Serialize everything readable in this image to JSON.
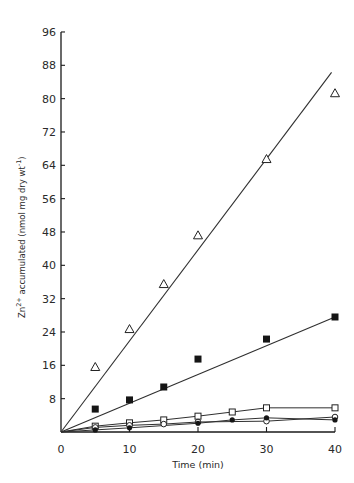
{
  "chart_data": {
    "type": "scatter",
    "title": "",
    "xlabel": "Time (min)",
    "ylabel": "Zn2+ accumulated (nmol mg dry wt-1)",
    "ylabel_parts": {
      "main": "Zn",
      "sup1": "2+",
      "mid": " accumulated (nmol  mg  dry  wt",
      "sup2": "-1",
      "end": ")"
    },
    "xlim": [
      0,
      40
    ],
    "ylim": [
      0,
      96
    ],
    "xticks": [
      0,
      10,
      20,
      30,
      40
    ],
    "yticks": [
      8,
      16,
      24,
      32,
      40,
      48,
      56,
      64,
      72,
      80,
      88,
      96
    ],
    "origin_label": "0",
    "grid": false,
    "legend": null,
    "series": [
      {
        "name": "open triangles",
        "marker": "triangle-open",
        "fit": "line",
        "fit_line": {
          "x": [
            0,
            39.5
          ],
          "y": [
            0,
            86.3
          ]
        },
        "x": [
          5,
          10,
          15,
          20,
          30,
          40
        ],
        "y": [
          15.6,
          24.7,
          35.5,
          47.2,
          65.5,
          81.3
        ]
      },
      {
        "name": "filled squares",
        "marker": "square-filled",
        "fit": "line",
        "fit_line": {
          "x": [
            0,
            40
          ],
          "y": [
            0,
            27.6
          ]
        },
        "x": [
          5,
          10,
          15,
          20,
          30,
          40
        ],
        "y": [
          5.5,
          7.7,
          10.8,
          17.5,
          22.3,
          27.6
        ]
      },
      {
        "name": "open squares",
        "marker": "square-open",
        "fit": "connected",
        "x": [
          0,
          5,
          10,
          15,
          20,
          25,
          30,
          40
        ],
        "y": [
          0,
          1.4,
          2.2,
          2.9,
          3.8,
          4.8,
          5.8,
          5.8
        ]
      },
      {
        "name": "open circles",
        "marker": "circle-open",
        "fit": "connected",
        "x": [
          0,
          5,
          10,
          15,
          20,
          30,
          40
        ],
        "y": [
          0,
          1.1,
          1.6,
          1.9,
          2.4,
          2.6,
          3.6
        ]
      },
      {
        "name": "filled circles",
        "marker": "circle-filled",
        "fit": "connected",
        "x": [
          0,
          5,
          10,
          20,
          25,
          30,
          40
        ],
        "y": [
          0,
          0.5,
          1.0,
          2.1,
          2.9,
          3.4,
          2.9
        ]
      }
    ]
  }
}
